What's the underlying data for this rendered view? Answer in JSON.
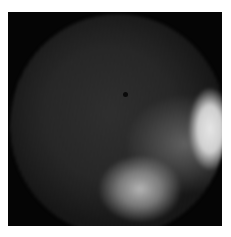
{
  "image": {
    "description": "Grayscale circular endoscopic-style view with bright region at right and lower-center",
    "colors": {
      "background": "#ffffff",
      "frame": "#050505",
      "bright_region": "#ebebeb",
      "dark_region": "#222222"
    }
  }
}
